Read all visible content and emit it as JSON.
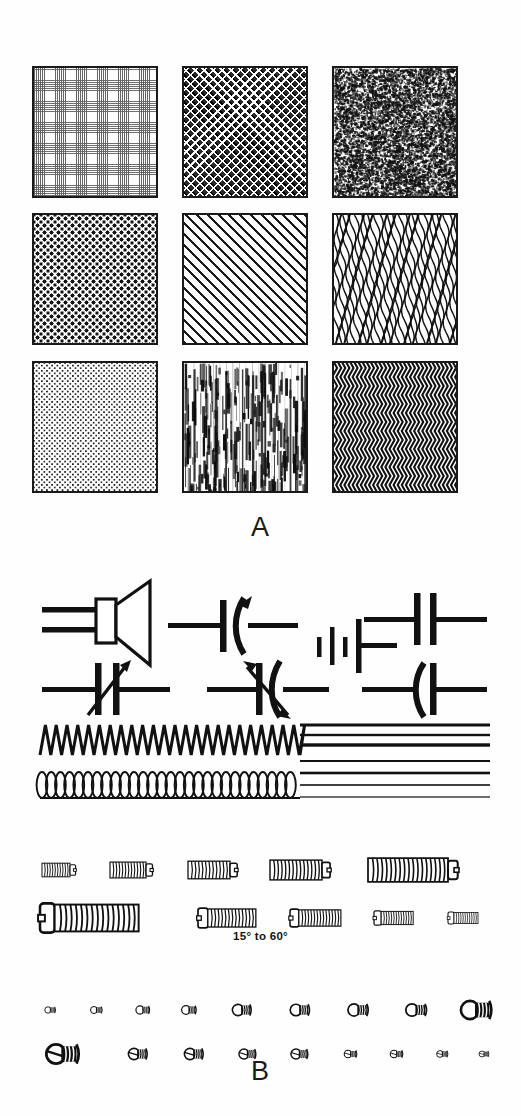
{
  "figure": {
    "caption_a": "A",
    "caption_b": "B",
    "panel_a_title": "texture-pattern-swatch-grid",
    "panel_b_title": "electrical-symbols-and-machine-screws"
  },
  "panel_a": {
    "rows": 3,
    "columns": 3,
    "swatches": [
      {
        "id": "swatch-1",
        "name": "fine-woven-mesh",
        "row": 1,
        "column": 1,
        "tone": "light"
      },
      {
        "id": "swatch-2",
        "name": "dense-crosshatch",
        "row": 1,
        "column": 2,
        "tone": "dark"
      },
      {
        "id": "swatch-3",
        "name": "random-noise-speckle",
        "row": 1,
        "column": 3,
        "tone": "medium"
      },
      {
        "id": "swatch-4",
        "name": "coarse-dark-dots",
        "row": 2,
        "column": 1,
        "tone": "dark"
      },
      {
        "id": "swatch-5",
        "name": "diagonal-ruled-lines",
        "row": 2,
        "column": 2,
        "tone": "medium"
      },
      {
        "id": "swatch-6",
        "name": "vertical-wavy-lines",
        "row": 2,
        "column": 3,
        "tone": "medium"
      },
      {
        "id": "swatch-7",
        "name": "fine-stipple-dots",
        "row": 3,
        "column": 1,
        "tone": "light"
      },
      {
        "id": "swatch-8",
        "name": "wood-grain-streaks",
        "row": 3,
        "column": 2,
        "tone": "light"
      },
      {
        "id": "swatch-9",
        "name": "herringbone-zigzag",
        "row": 3,
        "column": 3,
        "tone": "dark"
      }
    ]
  },
  "panel_b": {
    "annotation": "15° to 60°",
    "symbol_rows": [
      {
        "id": "symbol-row-1",
        "items": [
          "loudspeaker-symbol",
          "variable-capacitor-symbol",
          "battery-cell-symbol",
          "fixed-capacitor-symbol"
        ]
      },
      {
        "id": "symbol-row-2",
        "items": [
          "variable-capacitor-arrow-symbol",
          "trimmer-capacitor-symbol",
          "polarized-capacitor-symbol"
        ]
      }
    ],
    "line_rows": [
      {
        "id": "resistor-zigzag-line",
        "name": "zigzag-resistor-line"
      },
      {
        "id": "inductor-coil-line",
        "name": "coil-inductor-line"
      }
    ],
    "rule_lines": {
      "name": "horizontal-rule-weights",
      "count": 7,
      "weights": [
        3.0,
        2.4,
        3.4,
        2.0,
        2.6,
        1.6,
        1.2
      ]
    },
    "screw_rows": [
      {
        "id": "screw-row-1",
        "name": "fillister-head-screws-ascending",
        "count": 5,
        "lengths": [
          28,
          36,
          42,
          52,
          80
        ]
      },
      {
        "id": "screw-row-2",
        "name": "fillister-head-screws-descending",
        "count": 5,
        "lengths": [
          84,
          48,
          42,
          32,
          24
        ]
      },
      {
        "id": "screw-row-3",
        "name": "round-head-screw-profiles-ascending",
        "count": 9
      },
      {
        "id": "screw-row-4",
        "name": "slotted-round-head-screws-descending",
        "count": 9
      }
    ]
  }
}
